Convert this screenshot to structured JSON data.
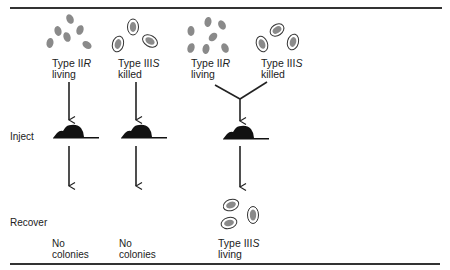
{
  "diagram": {
    "row_labels": {
      "inject": "Inject",
      "recover": "Recover"
    },
    "columns": [
      {
        "inputs": [
          {
            "type_prefix": "Type II",
            "type_suffix": "R",
            "state": "living",
            "cells": "rough-uncapsulated"
          }
        ],
        "result": {
          "line1": "No",
          "line2": "colonies"
        }
      },
      {
        "inputs": [
          {
            "type_prefix": "Type III",
            "type_suffix": "S",
            "state": "killed",
            "cells": "smooth-capsulated"
          }
        ],
        "result": {
          "line1": "No",
          "line2": "colonies"
        }
      },
      {
        "inputs": [
          {
            "type_prefix": "Type II",
            "type_suffix": "R",
            "state": "living",
            "cells": "rough-uncapsulated"
          },
          {
            "type_prefix": "Type III",
            "type_suffix": "S",
            "state": "killed",
            "cells": "smooth-capsulated"
          }
        ],
        "result": {
          "type_prefix": "Type III",
          "type_suffix": "S",
          "state": "living",
          "cells": "smooth-capsulated"
        }
      }
    ],
    "colors": {
      "cell_fill": "#8a8a8a",
      "capsule_stroke": "#333333",
      "mouse": "#111111",
      "lines": "#222222"
    }
  }
}
